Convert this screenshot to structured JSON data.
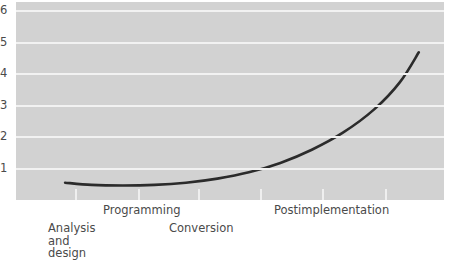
{
  "chart_data": {
    "type": "line",
    "title": "",
    "subtitle": "",
    "xlabel": "",
    "ylabel": "",
    "grid": true,
    "legend": false,
    "legend_position": "none",
    "plot_background_color": "#d2d2d2",
    "gridline_color": "#f2f2f2",
    "line_color": "#2b2b2b",
    "line_width": 2.6,
    "ylim": [
      0,
      6.3
    ],
    "yticks": [
      1,
      2,
      3,
      4,
      5,
      6
    ],
    "ytick_labels": [
      "1",
      "2",
      "3",
      "4",
      "5",
      "6"
    ],
    "xlim": [
      0,
      6.8
    ],
    "xticks": [
      1,
      2,
      3,
      4,
      5,
      6
    ],
    "xtick_labels": [
      "",
      "",
      "",
      "",
      "",
      ""
    ],
    "categories": [
      "Analysis\nand\ndesign",
      "Programming",
      "Conversion",
      "Postimplementation"
    ],
    "series": [
      {
        "name": "Relative cost to fix an error",
        "x": [
          0.78,
          1.2,
          1.7,
          2.2,
          2.7,
          3.2,
          3.7,
          4.2,
          4.7,
          5.2,
          5.7,
          6.1,
          6.4
        ],
        "values": [
          0.55,
          0.48,
          0.46,
          0.48,
          0.55,
          0.68,
          0.88,
          1.18,
          1.6,
          2.15,
          2.9,
          3.75,
          4.7
        ]
      }
    ],
    "annotations": []
  },
  "yaxis": {
    "labels": [
      {
        "text": "6",
        "value": 6
      },
      {
        "text": "5",
        "value": 5
      },
      {
        "text": "4",
        "value": 4
      },
      {
        "text": "3",
        "value": 3
      },
      {
        "text": "2",
        "value": 2
      },
      {
        "text": "1",
        "value": 1
      }
    ]
  },
  "xaxis": {
    "labels": [
      {
        "text": "Analysis\nand\ndesign",
        "left": 48,
        "top": 22
      },
      {
        "text": "Programming",
        "left": 103,
        "top": 4
      },
      {
        "text": "Conversion",
        "left": 169,
        "top": 22
      },
      {
        "text": "Postimplementation",
        "left": 274,
        "top": 4
      }
    ],
    "tick_positions": [
      75,
      138,
      198,
      260,
      322,
      385
    ]
  }
}
